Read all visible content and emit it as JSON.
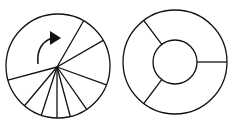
{
  "figure": {
    "stroke_color": "#111111",
    "background": "#ffffff",
    "left_diagram": {
      "description": "circle divided by radial lines from an off-center point, with a clockwise arrow",
      "circle": {
        "cx": 58,
        "cy": 66,
        "r": 52
      },
      "hub": {
        "x": 57,
        "y": 67
      },
      "spoke_angles_deg": [
        -60,
        -30,
        20,
        55,
        75,
        90,
        108,
        130,
        165
      ],
      "arrow": {
        "label": "clockwise-rotation-arrow"
      }
    },
    "right_diagram": {
      "description": "annulus (ring) divided into three sectors",
      "outer_circle": {
        "cx": 175,
        "cy": 62,
        "r": 52
      },
      "inner_circle": {
        "cx": 175,
        "cy": 62,
        "r": 22
      },
      "divider_angles_deg": [
        0,
        127,
        233
      ]
    }
  }
}
